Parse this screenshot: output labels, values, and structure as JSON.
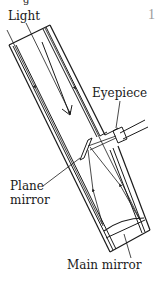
{
  "figure": {
    "number": "1",
    "top_partial_text": "g"
  },
  "labels": {
    "light": "Light",
    "eyepiece": "Eyepiece",
    "plane_mirror_line1": "Plane",
    "plane_mirror_line2": "mirror",
    "main_mirror": "Main mirror"
  },
  "colors": {
    "ink": "#1a1a1a",
    "figure_number": "#9a9a9a",
    "background": "#ffffff"
  }
}
